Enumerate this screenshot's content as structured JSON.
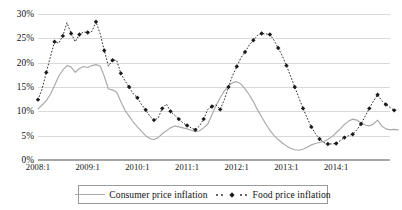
{
  "chart_data": {
    "type": "line",
    "title": "",
    "subtitle": "",
    "xlabel": "",
    "ylabel": "",
    "ylim": [
      0,
      30
    ],
    "yticks": [
      0,
      5,
      10,
      15,
      20,
      25,
      30
    ],
    "ytick_labels": [
      "0%",
      "5%",
      "10%",
      "15%",
      "20%",
      "25%",
      "30%"
    ],
    "xtick_labels": [
      "2008:1",
      "2009:1",
      "2010:1",
      "2011:1",
      "2012:1",
      "2013:1",
      "2014:1"
    ],
    "xtick_positions": [
      0,
      12,
      24,
      36,
      48,
      60,
      72
    ],
    "x_count": 86,
    "grid": true,
    "legend_position": "bottom-center",
    "series": [
      {
        "name": "Consumer price inflation",
        "style": "solid",
        "color": "#a9a9a9",
        "marker": "none",
        "values": [
          10.5,
          11.3,
          12.2,
          13.5,
          15.3,
          17.2,
          18.5,
          19.4,
          19.1,
          18.0,
          18.8,
          19.2,
          19.0,
          19.4,
          19.6,
          19.3,
          17.2,
          14.6,
          14.4,
          13.9,
          12.0,
          10.2,
          9.0,
          7.8,
          6.8,
          5.9,
          5.0,
          4.4,
          4.2,
          4.6,
          5.4,
          6.0,
          6.6,
          7.0,
          6.8,
          6.6,
          6.4,
          6.1,
          5.8,
          6.0,
          6.6,
          7.4,
          9.3,
          11.2,
          12.8,
          14.2,
          15.2,
          15.9,
          16.1,
          15.6,
          14.6,
          13.4,
          12.0,
          10.3,
          8.9,
          7.4,
          6.1,
          5.0,
          4.2,
          3.5,
          2.9,
          2.4,
          2.1,
          2.0,
          2.2,
          2.6,
          3.1,
          3.4,
          3.6,
          3.8,
          4.2,
          4.8,
          5.6,
          6.4,
          7.3,
          8.0,
          8.4,
          8.2,
          7.6,
          7.2,
          7.0,
          7.4,
          8.2,
          7.0,
          6.4,
          6.2,
          6.3,
          6.2
        ]
      },
      {
        "name": "Food price inflation",
        "style": "dotted",
        "color": "#1a1a1a",
        "marker": "diamond",
        "values": [
          12.4,
          14.6,
          18.0,
          21.2,
          24.3,
          24.0,
          25.5,
          28.2,
          26.0,
          24.3,
          25.8,
          26.3,
          26.2,
          26.4,
          28.4,
          26.0,
          22.5,
          19.3,
          20.5,
          20.5,
          17.8,
          16.3,
          15.0,
          13.6,
          12.8,
          11.4,
          10.3,
          9.0,
          8.2,
          8.6,
          10.6,
          11.5,
          10.0,
          9.2,
          8.4,
          7.6,
          7.1,
          6.6,
          6.2,
          7.0,
          8.4,
          10.4,
          11.0,
          11.3,
          10.4,
          12.4,
          15.0,
          17.4,
          19.2,
          21.0,
          22.2,
          23.6,
          24.6,
          25.6,
          26.0,
          25.9,
          25.8,
          24.6,
          23.0,
          21.4,
          19.4,
          17.2,
          15.0,
          12.8,
          10.6,
          8.6,
          6.8,
          5.4,
          4.3,
          3.6,
          3.3,
          3.3,
          3.4,
          4.0,
          4.6,
          5.0,
          5.3,
          6.2,
          7.4,
          9.0,
          10.6,
          12.1,
          13.4,
          12.2,
          11.4,
          10.8,
          10.2,
          10.3
        ]
      }
    ]
  }
}
